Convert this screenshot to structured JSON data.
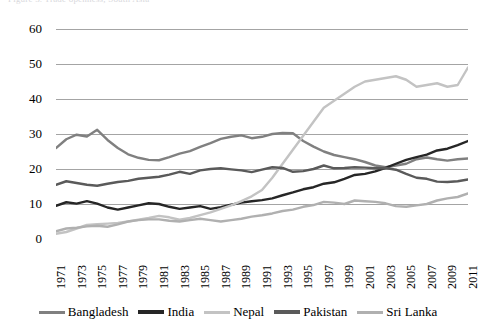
{
  "title_sliver": "Figure 3. Trade openness, South Asia",
  "legend": {
    "position": "bottom",
    "items": [
      {
        "label": "Bangladesh",
        "color": "#808080"
      },
      {
        "label": "India",
        "color": "#262626"
      },
      {
        "label": "Nepal",
        "color": "#c3c3c3"
      },
      {
        "label": "Pakistan",
        "color": "#5a5a5a"
      },
      {
        "label": "Sri Lanka",
        "color": "#b0b0b0"
      }
    ]
  },
  "axes": {
    "y_ticks": [
      "0",
      "10",
      "20",
      "30",
      "40",
      "50",
      "60"
    ],
    "x_ticks": [
      "1971",
      "1973",
      "1975",
      "1977",
      "1979",
      "1981",
      "1983",
      "1985",
      "1987",
      "1989",
      "1991",
      "1993",
      "1995",
      "1997",
      "1999",
      "2001",
      "2003",
      "2005",
      "2007",
      "2009",
      "2011"
    ]
  },
  "chart_data": {
    "type": "line",
    "title": "",
    "subtitle": "",
    "xlabel": "",
    "ylabel": "",
    "xlim": [
      1971,
      2011
    ],
    "ylim": [
      0,
      60
    ],
    "ytick_step": 10,
    "grid": "horizontal",
    "legend_position": "bottom",
    "x": [
      1971,
      1972,
      1973,
      1974,
      1975,
      1976,
      1977,
      1978,
      1979,
      1980,
      1981,
      1982,
      1983,
      1984,
      1985,
      1986,
      1987,
      1988,
      1989,
      1990,
      1991,
      1992,
      1993,
      1994,
      1995,
      1996,
      1997,
      1998,
      1999,
      2000,
      2001,
      2002,
      2003,
      2004,
      2005,
      2006,
      2007,
      2008,
      2009,
      2010,
      2011
    ],
    "series": [
      {
        "name": "Bangladesh",
        "color": "#808080",
        "values": [
          26.0,
          28.5,
          29.8,
          29.3,
          31.2,
          28.3,
          26.0,
          24.2,
          23.2,
          22.6,
          22.5,
          23.4,
          24.4,
          25.1,
          26.3,
          27.4,
          28.6,
          29.2,
          29.6,
          28.8,
          29.2,
          30.0,
          30.3,
          30.2,
          28.0,
          26.4,
          25.0,
          24.0,
          23.4,
          22.8,
          22.0,
          21.0,
          20.5,
          21.0,
          21.5,
          22.8,
          23.3,
          22.8,
          22.4,
          22.8,
          23.0
        ]
      },
      {
        "name": "India",
        "color": "#262626",
        "values": [
          9.5,
          10.5,
          10.1,
          10.8,
          10.1,
          9.0,
          8.4,
          9.0,
          9.6,
          10.2,
          10.0,
          9.2,
          8.6,
          9.0,
          9.4,
          8.6,
          9.1,
          9.8,
          10.4,
          10.8,
          11.1,
          11.6,
          12.5,
          13.3,
          14.2,
          14.8,
          15.8,
          16.2,
          17.2,
          18.3,
          18.6,
          19.3,
          20.3,
          21.5,
          22.6,
          23.4,
          24.1,
          25.3,
          25.8,
          26.8,
          28.0
        ]
      },
      {
        "name": "Nepal",
        "color": "#c3c3c3",
        "values": [
          1.5,
          2.0,
          3.0,
          4.0,
          4.2,
          4.4,
          4.6,
          5.0,
          5.5,
          6.0,
          6.6,
          6.2,
          5.5,
          6.0,
          6.8,
          7.6,
          8.6,
          9.6,
          10.8,
          12.2,
          14.0,
          17.5,
          21.5,
          25.5,
          29.5,
          33.5,
          37.5,
          39.5,
          41.5,
          43.5,
          45.0,
          45.5,
          46.0,
          46.5,
          45.5,
          43.5,
          44.0,
          44.5,
          43.5,
          44.0,
          49.0
        ]
      },
      {
        "name": "Pakistan",
        "color": "#5a5a5a",
        "values": [
          15.5,
          16.5,
          16.0,
          15.5,
          15.2,
          15.8,
          16.3,
          16.6,
          17.2,
          17.5,
          17.8,
          18.4,
          19.2,
          18.6,
          19.6,
          20.0,
          20.2,
          19.9,
          19.6,
          19.1,
          19.8,
          20.5,
          20.3,
          19.2,
          19.4,
          20.0,
          21.0,
          20.2,
          20.3,
          20.5,
          20.4,
          20.2,
          20.3,
          19.8,
          18.6,
          17.5,
          17.2,
          16.4,
          16.3,
          16.5,
          17.0
        ]
      },
      {
        "name": "Sri Lanka",
        "color": "#b0b0b0",
        "values": [
          2.2,
          3.0,
          3.2,
          3.6,
          3.8,
          3.5,
          4.2,
          5.0,
          5.4,
          5.6,
          5.6,
          5.2,
          5.0,
          5.4,
          5.8,
          5.4,
          5.0,
          5.4,
          5.8,
          6.4,
          6.8,
          7.3,
          8.0,
          8.4,
          9.2,
          9.7,
          10.6,
          10.4,
          10.0,
          11.0,
          10.8,
          10.6,
          10.2,
          9.4,
          9.2,
          9.6,
          10.0,
          11.0,
          11.6,
          12.0,
          13.0
        ]
      }
    ]
  }
}
